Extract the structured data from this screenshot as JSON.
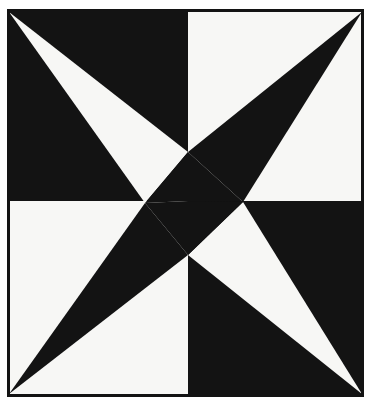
{
  "figure": {
    "canvas": {
      "width": 372,
      "height": 406
    },
    "colors": {
      "ink": "#131313",
      "paper": "#f7f7f5",
      "page_background": "#ffffff",
      "frame_stroke": "#131313"
    },
    "frame": {
      "x": 7,
      "y": 9,
      "width": 357,
      "height": 388,
      "stroke_width": 3
    },
    "divider_lines": {
      "vertical_x": 188,
      "horizontal_y": 201
    },
    "quadrants": [
      {
        "name": "top-left",
        "fill": "ink",
        "x": 7,
        "y": 9,
        "width": 181,
        "height": 192
      },
      {
        "name": "top-right",
        "fill": "paper",
        "x": 188,
        "y": 9,
        "width": 176,
        "height": 192
      },
      {
        "name": "bottom-left",
        "fill": "paper",
        "x": 7,
        "y": 201,
        "width": 181,
        "height": 196
      },
      {
        "name": "bottom-right",
        "fill": "ink",
        "x": 188,
        "y": 201,
        "width": 176,
        "height": 196
      }
    ],
    "hub_points": {
      "top": {
        "x": 188,
        "y": 152
      },
      "left": {
        "x": 145,
        "y": 203
      },
      "right": {
        "x": 243,
        "y": 202
      },
      "bottom": {
        "x": 188,
        "y": 255
      },
      "center": {
        "x": 188,
        "y": 201
      }
    },
    "spokes": [
      {
        "name": "top-left-spoke",
        "fill": "paper",
        "apex": {
          "x": 9,
          "y": 12
        },
        "base_a": {
          "x": 188,
          "y": 152
        },
        "base_b": {
          "x": 145,
          "y": 203
        }
      },
      {
        "name": "top-right-spoke",
        "fill": "ink",
        "apex": {
          "x": 362,
          "y": 12
        },
        "base_a": {
          "x": 188,
          "y": 152
        },
        "base_b": {
          "x": 243,
          "y": 202
        }
      },
      {
        "name": "bottom-left-spoke",
        "fill": "ink",
        "apex": {
          "x": 9,
          "y": 394
        },
        "base_a": {
          "x": 145,
          "y": 203
        },
        "base_b": {
          "x": 188,
          "y": 255
        }
      },
      {
        "name": "bottom-right-spoke",
        "fill": "paper",
        "apex": {
          "x": 362,
          "y": 394
        },
        "base_a": {
          "x": 243,
          "y": 202
        },
        "base_b": {
          "x": 188,
          "y": 255
        }
      }
    ],
    "center_wedges": [
      {
        "name": "center-upper-wedge",
        "fill": "ink",
        "points": "188,152 243,202 188,201 145,203"
      },
      {
        "name": "center-lower-wedge",
        "fill": "ink",
        "points": "145,203 188,201 243,202 188,255"
      }
    ]
  }
}
